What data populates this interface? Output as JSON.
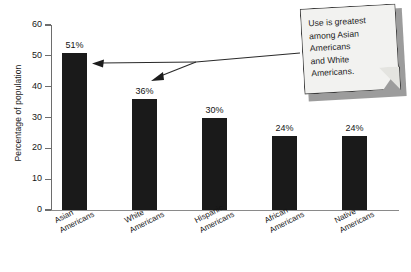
{
  "chart_data": {
    "type": "bar",
    "title": "",
    "subtitle": "",
    "xlabel": "",
    "ylabel": "Percentage of population",
    "ylim": [
      0,
      60
    ],
    "yticks": [
      0,
      10,
      20,
      30,
      40,
      50,
      60
    ],
    "ytick_labels": [
      "0",
      "10",
      "20",
      "30",
      "40",
      "50",
      "60"
    ],
    "grid": false,
    "legend": false,
    "categories": [
      "Asian Americans",
      "White Americans",
      "Hispanic Americans",
      "African Americans",
      "Native Americans"
    ],
    "category_lines": [
      [
        "Asian",
        "Americans"
      ],
      [
        "White",
        "Americans"
      ],
      [
        "Hispanic",
        "Americans"
      ],
      [
        "African",
        "Americans"
      ],
      [
        "Native",
        "Americans"
      ]
    ],
    "values": [
      51,
      36,
      30,
      24,
      24
    ],
    "value_labels": [
      "51%",
      "36%",
      "30%",
      "24%",
      "24%"
    ],
    "bar_color": "#1a1a1a",
    "annotations": [
      {
        "text": "Use is greatest among Asian Americans and White Americans.",
        "lines": [
          "Use is greatest",
          "among Asian",
          "Americans",
          "and White",
          "Americans."
        ],
        "points_to": [
          "Asian Americans",
          "White Americans"
        ]
      }
    ]
  },
  "axes": {
    "y_title": "Percentage of population"
  },
  "callout": {
    "lines": [
      "Use is greatest",
      "among Asian",
      "Americans",
      "and White",
      "Americans."
    ],
    "text": "Use is greatest among Asian Americans and White Americans."
  }
}
